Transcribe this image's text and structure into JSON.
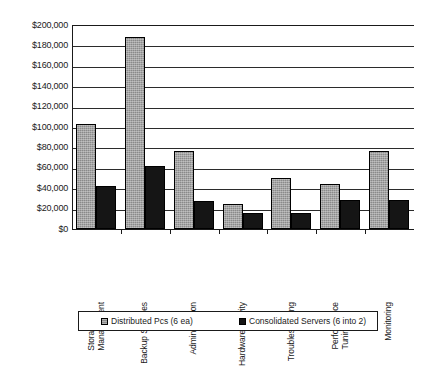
{
  "chart_data": {
    "type": "bar",
    "title": "",
    "subtitle": "",
    "xlabel": "",
    "ylabel": "",
    "ylim": [
      0,
      200000
    ],
    "ytick_step": 20000,
    "grid": true,
    "legend_position": "bottom",
    "currency_prefix": "$",
    "categories": [
      "Storage Management",
      "Backup Services",
      "Administration",
      "Hardware Activity",
      "Troubleshooting",
      "Performance Tuning",
      "Monitoring"
    ],
    "category_lines": [
      [
        "Storage",
        "Management"
      ],
      [
        "Backup Services"
      ],
      [
        "Administration"
      ],
      [
        "Hardware Activity"
      ],
      [
        "Troubleshooting"
      ],
      [
        "Performance",
        "Tuning"
      ],
      [
        "Monitoring"
      ]
    ],
    "ytick_labels": [
      "$200,000",
      "$180,000",
      "$160,000",
      "$140,000",
      "$120,000",
      "$100,000",
      "$80,000",
      "$60,000",
      "$40,000",
      "$20,000",
      "$0"
    ],
    "ytick_values": [
      200000,
      180000,
      160000,
      140000,
      120000,
      100000,
      80000,
      60000,
      40000,
      20000,
      0
    ],
    "series": [
      {
        "name": "Distributed Pcs (6 ea)",
        "color": "#8a8a8a",
        "values": [
          103000,
          188000,
          76000,
          25000,
          50000,
          44000,
          76000
        ]
      },
      {
        "name": "Consolidated Servers  (6 into 2)",
        "color": "#151515",
        "values": [
          42000,
          62000,
          27000,
          16000,
          16000,
          28000,
          28000
        ]
      }
    ]
  },
  "legend": {
    "entries": [
      {
        "label": "Distributed Pcs (6 ea)",
        "color": "#8a8a8a"
      },
      {
        "label": "Consolidated Servers  (6 into 2)",
        "color": "#151515"
      }
    ]
  }
}
